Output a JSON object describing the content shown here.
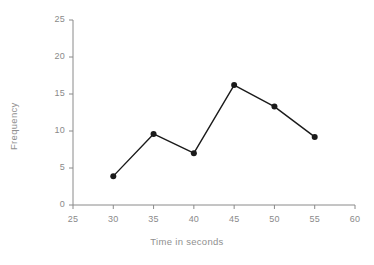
{
  "chart_data": {
    "type": "line",
    "title": "",
    "xlabel": "Time in seconds",
    "ylabel": "Frequency",
    "xlim": [
      25,
      60
    ],
    "ylim": [
      0,
      25
    ],
    "xticks": [
      25,
      30,
      35,
      40,
      45,
      50,
      55,
      60
    ],
    "yticks": [
      0,
      5,
      10,
      15,
      20,
      25
    ],
    "xtick_labels": [
      "25",
      "30",
      "35",
      "40",
      "45",
      "50",
      "55",
      "60"
    ],
    "ytick_labels": [
      "0",
      "5",
      "10",
      "15",
      "20",
      "25"
    ],
    "grid": false,
    "legend": false,
    "x": [
      30,
      35,
      40,
      45,
      50,
      55
    ],
    "values": [
      3.9,
      9.6,
      7.0,
      16.2,
      13.3,
      9.2
    ],
    "series": [
      {
        "name": "Frequency",
        "x": [
          30,
          35,
          40,
          45,
          50,
          55
        ],
        "values": [
          3.9,
          9.6,
          7.0,
          16.2,
          13.3,
          9.2
        ]
      }
    ],
    "marker": "circle",
    "line_color": "#1a1a1a",
    "marker_color": "#1a1a1a",
    "axis_color": "#8a8a8a",
    "tick_label_color": "#8a8a8a"
  }
}
